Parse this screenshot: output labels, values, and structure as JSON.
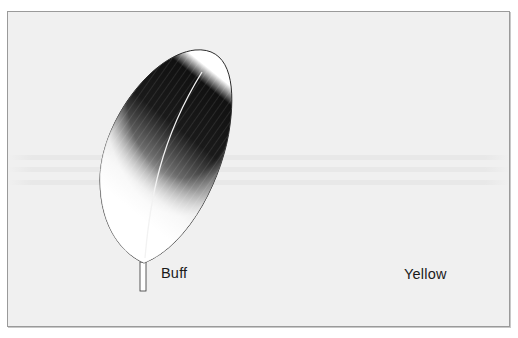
{
  "figure": {
    "background": "#f0f0f0",
    "border_color": "#9a9a9a",
    "feathers": [
      {
        "name": "buff-feather",
        "label": "Buff"
      },
      {
        "name": "yellow-feather",
        "label": "Yellow"
      }
    ]
  }
}
